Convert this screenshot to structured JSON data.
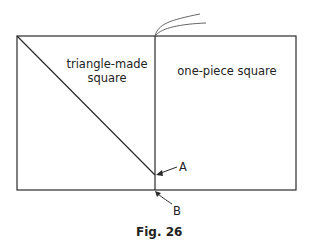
{
  "figure": {
    "caption": "Fig. 26",
    "left_label_line1": "triangle-made",
    "left_label_line2": "square",
    "right_label": "one-piece square",
    "point_a": "A",
    "point_b": "B"
  },
  "colors": {
    "line": "#2a2a2a",
    "background": "#ffffff"
  }
}
